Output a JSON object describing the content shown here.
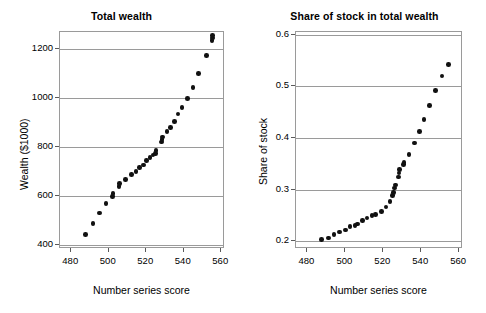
{
  "figure": {
    "width": 486,
    "height": 313,
    "background": "#ffffff",
    "ink_color": "#111111",
    "axis_color": "#9a9a9a"
  },
  "panels": [
    {
      "id": "total-wealth",
      "title": "Total wealth",
      "xlabel": "Number series score",
      "ylabel": "Wealth ($1000)",
      "xticks": [
        480,
        500,
        520,
        540,
        560
      ],
      "yticks": [
        400,
        600,
        800,
        1000,
        1200
      ],
      "xlim": [
        474,
        562
      ],
      "ylim": [
        385,
        1270
      ]
    },
    {
      "id": "share-of-stock",
      "title": "Share of stock in total wealth",
      "xlabel": "Number series score",
      "ylabel": "Share of stock",
      "xticks": [
        480,
        500,
        520,
        540,
        560
      ],
      "yticks": [
        "0.2",
        "0.3",
        "0.4",
        "0.5",
        "0.6"
      ],
      "xlim": [
        474,
        562
      ],
      "ylim": [
        0.185,
        0.605
      ]
    }
  ],
  "chart_data": [
    {
      "type": "scatter",
      "title": "Total wealth",
      "xlabel": "Number series score",
      "ylabel": "Wealth ($1000)",
      "xlim": [
        474,
        562
      ],
      "ylim": [
        385,
        1270
      ],
      "xticks": [
        480,
        500,
        520,
        540,
        560
      ],
      "yticks": [
        400,
        600,
        800,
        1000,
        1200
      ],
      "grid": "horizontal",
      "legend": "none",
      "series": [
        {
          "name": "Total wealth",
          "points": [
            [
              487.5,
              445
            ],
            [
              491.5,
              490
            ],
            [
              495.0,
              532
            ],
            [
              498.5,
              570
            ],
            [
              502.0,
              600
            ],
            [
              502.3,
              612
            ],
            [
              505.5,
              640
            ],
            [
              505.8,
              652
            ],
            [
              509.0,
              668
            ],
            [
              512.0,
              690
            ],
            [
              514.5,
              700
            ],
            [
              516.5,
              718
            ],
            [
              518.5,
              728
            ],
            [
              520.0,
              745
            ],
            [
              522.0,
              757
            ],
            [
              523.5,
              768
            ],
            [
              525.0,
              775
            ],
            [
              525.3,
              787
            ],
            [
              528.0,
              822
            ],
            [
              528.3,
              832
            ],
            [
              528.6,
              842
            ],
            [
              531.0,
              865
            ],
            [
              533.0,
              880
            ],
            [
              535.0,
              905
            ],
            [
              537.0,
              935
            ],
            [
              539.0,
              962
            ],
            [
              542.0,
              998
            ],
            [
              545.0,
              1043
            ],
            [
              548.0,
              1100
            ],
            [
              552.0,
              1175
            ],
            [
              555.0,
              1235
            ],
            [
              555.2,
              1245
            ],
            [
              555.4,
              1255
            ]
          ]
        }
      ]
    },
    {
      "type": "scatter",
      "title": "Share of stock in total wealth",
      "xlabel": "Number series score",
      "ylabel": "Share of stock",
      "xlim": [
        474,
        562
      ],
      "ylim": [
        0.185,
        0.605
      ],
      "xticks": [
        480,
        500,
        520,
        540,
        560
      ],
      "yticks": [
        0.2,
        0.3,
        0.4,
        0.5,
        0.6
      ],
      "grid": "horizontal",
      "legend": "none",
      "series": [
        {
          "name": "Share of stock",
          "points": [
            [
              487.5,
              0.203
            ],
            [
              491.0,
              0.206
            ],
            [
              494.0,
              0.213
            ],
            [
              497.0,
              0.218
            ],
            [
              500.0,
              0.222
            ],
            [
              502.5,
              0.228
            ],
            [
              505.0,
              0.231
            ],
            [
              506.5,
              0.233
            ],
            [
              509.0,
              0.24
            ],
            [
              511.5,
              0.245
            ],
            [
              514.0,
              0.25
            ],
            [
              516.0,
              0.252
            ],
            [
              519.0,
              0.258
            ],
            [
              521.5,
              0.266
            ],
            [
              523.5,
              0.277
            ],
            [
              525.0,
              0.288
            ],
            [
              525.3,
              0.294
            ],
            [
              526.0,
              0.303
            ],
            [
              526.3,
              0.309
            ],
            [
              528.0,
              0.324
            ],
            [
              528.2,
              0.332
            ],
            [
              528.4,
              0.339
            ],
            [
              530.5,
              0.348
            ],
            [
              531.0,
              0.352
            ],
            [
              533.5,
              0.368
            ],
            [
              536.5,
              0.39
            ],
            [
              539.0,
              0.412
            ],
            [
              541.5,
              0.436
            ],
            [
              544.5,
              0.463
            ],
            [
              547.5,
              0.492
            ],
            [
              551.0,
              0.52
            ],
            [
              554.5,
              0.542
            ]
          ]
        }
      ]
    }
  ]
}
